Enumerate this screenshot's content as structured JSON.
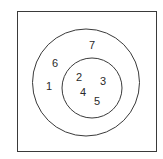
{
  "diagram": {
    "type": "venn",
    "universal_set": {
      "shape": "rectangle",
      "x": 17,
      "y": 11,
      "width": 139,
      "height": 140,
      "elements": [
        "7",
        "6",
        "1"
      ]
    },
    "outer_circle": {
      "cx": 86,
      "cy": 82.5,
      "r": 53.5
    },
    "inner_circle": {
      "cx": 92,
      "cy": 88,
      "r": 30
    },
    "stroke_color": "#3a3a3a",
    "text_color": "#2a2a2a",
    "labels": [
      {
        "text": "7",
        "x": 92,
        "y": 45,
        "region": "outer-circle-only"
      },
      {
        "text": "6",
        "x": 55,
        "y": 63,
        "region": "outer-circle-only"
      },
      {
        "text": "1",
        "x": 49,
        "y": 86,
        "region": "outer-circle-only"
      },
      {
        "text": "2",
        "x": 79,
        "y": 77,
        "region": "inner-circle"
      },
      {
        "text": "3",
        "x": 103,
        "y": 81,
        "region": "inner-circle"
      },
      {
        "text": "4",
        "x": 83,
        "y": 92,
        "region": "inner-circle"
      },
      {
        "text": "5",
        "x": 97,
        "y": 101,
        "region": "inner-circle"
      }
    ]
  }
}
